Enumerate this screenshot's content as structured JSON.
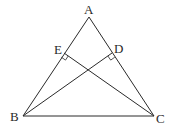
{
  "diagram": {
    "type": "triangle-with-altitudes",
    "points": {
      "A": {
        "label": "A",
        "x": 89,
        "y": 17
      },
      "B": {
        "label": "B",
        "x": 23,
        "y": 116
      },
      "C": {
        "label": "C",
        "x": 154,
        "y": 116
      },
      "D": {
        "label": "D",
        "x": 112,
        "y": 53
      },
      "E": {
        "label": "E",
        "x": 64,
        "y": 53
      }
    },
    "segments": [
      "AB",
      "AC",
      "BC",
      "BD",
      "CE"
    ],
    "right_angles": [
      "BDC at D",
      "CEB at E"
    ],
    "colors": {
      "stroke": "#2a2a2a",
      "background": "#ffffff"
    }
  }
}
